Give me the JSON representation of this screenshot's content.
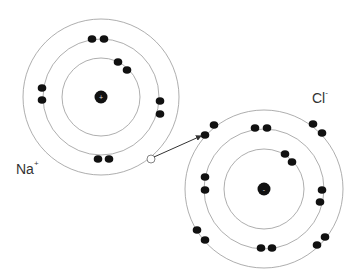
{
  "diagram": {
    "type": "ionic-bond-electron-transfer",
    "atoms": [
      {
        "id": "sodium",
        "symbol": "Na",
        "charge": "+",
        "nucleus_sign": "+",
        "center": [
          101,
          97
        ],
        "shell_radii": [
          39,
          58,
          78
        ],
        "electrons": [
          [
            92,
            39
          ],
          [
            104,
            39
          ],
          [
            118,
            62
          ],
          [
            127,
            70
          ],
          [
            42,
            88
          ],
          [
            42,
            100
          ],
          [
            160,
            101
          ],
          [
            160,
            114
          ],
          [
            98,
            159
          ],
          [
            109,
            159
          ]
        ],
        "vacancy": [
          151,
          159
        ]
      },
      {
        "id": "chlorine",
        "symbol": "Cl",
        "charge": "-",
        "nucleus_sign": "-",
        "center": [
          264,
          189
        ],
        "shell_radii": [
          40,
          60,
          79
        ],
        "electrons": [
          [
            214,
            125
          ],
          [
            205,
            135
          ],
          [
            255,
            128
          ],
          [
            267,
            128
          ],
          [
            313,
            124
          ],
          [
            322,
            133
          ],
          [
            285,
            154
          ],
          [
            292,
            162
          ],
          [
            205,
            177
          ],
          [
            205,
            190
          ],
          [
            322,
            190
          ],
          [
            320,
            202
          ],
          [
            197,
            230
          ],
          [
            205,
            240
          ],
          [
            325,
            237
          ],
          [
            317,
            245
          ],
          [
            261,
            248
          ],
          [
            272,
            248
          ]
        ]
      }
    ],
    "transfer_arrow": {
      "from": [
        154,
        157
      ],
      "to": [
        201,
        136
      ]
    },
    "labels": {
      "na": {
        "text": "Na",
        "superscript": "+"
      },
      "cl": {
        "text": "Cl",
        "superscript": "-"
      }
    }
  }
}
